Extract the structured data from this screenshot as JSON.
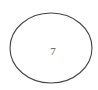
{
  "node": {
    "label": "7",
    "shape": "ellipse",
    "stroke_color": "#444444",
    "text_color": "#555555",
    "fill_color": "#ffffff"
  }
}
